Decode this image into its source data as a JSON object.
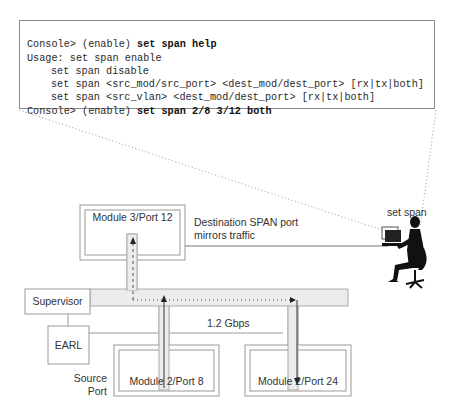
{
  "console": {
    "lines": [
      {
        "prefix": "Console> (enable) ",
        "command": "set span help"
      },
      {
        "prefix": "Usage: set span enable",
        "command": ""
      },
      {
        "prefix": "set span disable",
        "command": ""
      },
      {
        "prefix": "set span <src_mod/src_port> <dest_mod/dest_port> [rx|tx|both]",
        "command": ""
      },
      {
        "prefix": "set span <src_vlan> <dest_mod/dest_port> [rx|tx|both]",
        "command": ""
      },
      {
        "prefix": "Console> (enable) ",
        "command": "set span 2/8 3/12 both"
      }
    ]
  },
  "diagram": {
    "set_span_label": "set span",
    "destination_module": "Module 3/Port 12",
    "destination_note_line1": "Destination SPAN port",
    "destination_note_line2": "mirrors traffic",
    "supervisor": "Supervisor",
    "earl": "EARL",
    "bandwidth": "1.2 Gbps",
    "source_module": "Module 2/Port 8",
    "target_module": "Module 2/Port 24",
    "source_port_line1": "Source",
    "source_port_line2": "Port"
  },
  "colors": {
    "border": "#8a8a8a",
    "bus_fill": "#ececec",
    "text": "#333333"
  }
}
